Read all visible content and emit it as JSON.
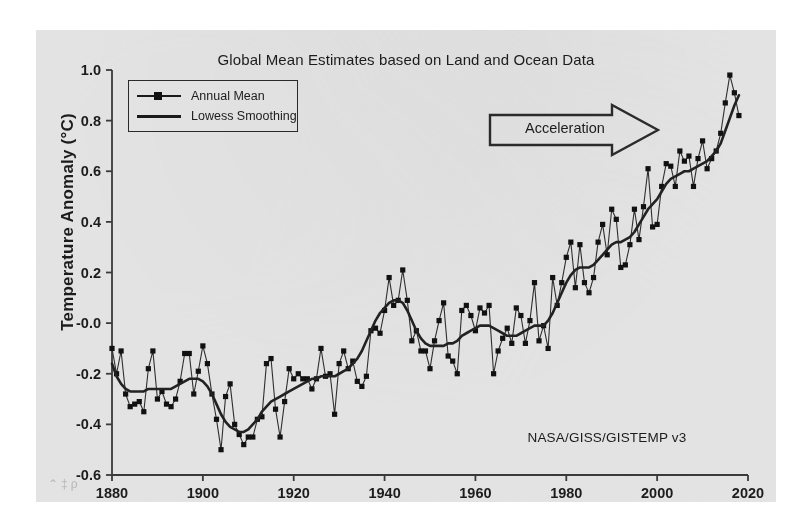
{
  "figure": {
    "title": "Global Mean Estimates based on Land and Ocean Data",
    "credit": "NASA/GISS/GISTEMP v3",
    "watermark": "⌃‡ρ"
  },
  "legend": {
    "items": [
      {
        "label": "Annual Mean",
        "key": "line-with-square-marker"
      },
      {
        "label": "Lowess Smoothing",
        "key": "plain-line"
      }
    ]
  },
  "annotation": {
    "label": "Acceleration",
    "shape": "right-block-arrow"
  },
  "axes": {
    "y_title": "Temperature Anomaly (°C)",
    "y_ticks": [
      "1.0",
      "0.8",
      "0.6",
      "0.4",
      "0.2",
      "-0.0",
      "-0.2",
      "-0.4",
      "-0.6"
    ],
    "x_ticks": [
      "1880",
      "1900",
      "1920",
      "1940",
      "1960",
      "1980",
      "2000",
      "2020"
    ]
  },
  "chart_data": {
    "type": "line",
    "title": "Global Mean Estimates based on Land and Ocean Data",
    "xlabel": "",
    "ylabel": "Temperature Anomaly (°C)",
    "xlim": [
      1880,
      2020
    ],
    "ylim": [
      -0.6,
      1.0
    ],
    "yticks": [
      -0.6,
      -0.4,
      -0.2,
      -0.0,
      0.2,
      0.4,
      0.6,
      0.8,
      1.0
    ],
    "xticks": [
      1880,
      1900,
      1920,
      1940,
      1960,
      1980,
      2000,
      2020
    ],
    "grid": false,
    "legend_position": "upper-left",
    "annotations": [
      {
        "text": "Acceleration",
        "x": 1990,
        "y": 0.83
      },
      {
        "text": "NASA/GISS/GISTEMP v3",
        "x": 1999,
        "y": -0.5
      }
    ],
    "x": [
      1880,
      1881,
      1882,
      1883,
      1884,
      1885,
      1886,
      1887,
      1888,
      1889,
      1890,
      1891,
      1892,
      1893,
      1894,
      1895,
      1896,
      1897,
      1898,
      1899,
      1900,
      1901,
      1902,
      1903,
      1904,
      1905,
      1906,
      1907,
      1908,
      1909,
      1910,
      1911,
      1912,
      1913,
      1914,
      1915,
      1916,
      1917,
      1918,
      1919,
      1920,
      1921,
      1922,
      1923,
      1924,
      1925,
      1926,
      1927,
      1928,
      1929,
      1930,
      1931,
      1932,
      1933,
      1934,
      1935,
      1936,
      1937,
      1938,
      1939,
      1940,
      1941,
      1942,
      1943,
      1944,
      1945,
      1946,
      1947,
      1948,
      1949,
      1950,
      1951,
      1952,
      1953,
      1954,
      1955,
      1956,
      1957,
      1958,
      1959,
      1960,
      1961,
      1962,
      1963,
      1964,
      1965,
      1966,
      1967,
      1968,
      1969,
      1970,
      1971,
      1972,
      1973,
      1974,
      1975,
      1976,
      1977,
      1978,
      1979,
      1980,
      1981,
      1982,
      1983,
      1984,
      1985,
      1986,
      1987,
      1988,
      1989,
      1990,
      1991,
      1992,
      1993,
      1994,
      1995,
      1996,
      1997,
      1998,
      1999,
      2000,
      2001,
      2002,
      2003,
      2004,
      2005,
      2006,
      2007,
      2008,
      2009,
      2010,
      2011,
      2012,
      2013,
      2014,
      2015,
      2016,
      2017,
      2018
    ],
    "series": [
      {
        "name": "Annual Mean",
        "marker": "square",
        "values": [
          -0.1,
          -0.2,
          -0.11,
          -0.28,
          -0.33,
          -0.32,
          -0.31,
          -0.35,
          -0.18,
          -0.11,
          -0.3,
          -0.27,
          -0.32,
          -0.33,
          -0.3,
          -0.23,
          -0.12,
          -0.12,
          -0.28,
          -0.19,
          -0.09,
          -0.16,
          -0.28,
          -0.38,
          -0.5,
          -0.29,
          -0.24,
          -0.4,
          -0.44,
          -0.48,
          -0.45,
          -0.45,
          -0.38,
          -0.37,
          -0.16,
          -0.14,
          -0.34,
          -0.45,
          -0.31,
          -0.18,
          -0.22,
          -0.2,
          -0.22,
          -0.22,
          -0.26,
          -0.22,
          -0.1,
          -0.21,
          -0.2,
          -0.36,
          -0.16,
          -0.11,
          -0.18,
          -0.15,
          -0.23,
          -0.25,
          -0.21,
          -0.03,
          -0.02,
          -0.04,
          0.05,
          0.18,
          0.07,
          0.09,
          0.21,
          0.09,
          -0.07,
          -0.03,
          -0.11,
          -0.11,
          -0.18,
          -0.07,
          0.01,
          0.08,
          -0.13,
          -0.15,
          -0.2,
          0.05,
          0.07,
          0.03,
          -0.03,
          0.06,
          0.04,
          0.07,
          -0.2,
          -0.11,
          -0.06,
          -0.02,
          -0.08,
          0.06,
          0.03,
          -0.08,
          0.01,
          0.16,
          -0.07,
          -0.01,
          -0.1,
          0.18,
          0.07,
          0.16,
          0.26,
          0.32,
          0.14,
          0.31,
          0.16,
          0.12,
          0.18,
          0.32,
          0.39,
          0.27,
          0.45,
          0.41,
          0.22,
          0.23,
          0.31,
          0.45,
          0.33,
          0.46,
          0.61,
          0.38,
          0.39,
          0.54,
          0.63,
          0.62,
          0.54,
          0.68,
          0.64,
          0.66,
          0.54,
          0.65,
          0.72,
          0.61,
          0.65,
          0.68,
          0.75,
          0.87,
          0.98,
          0.91,
          0.82
        ]
      },
      {
        "name": "Lowess Smoothing",
        "marker": "none",
        "values": [
          -0.16,
          -0.21,
          -0.24,
          -0.26,
          -0.27,
          -0.27,
          -0.27,
          -0.27,
          -0.26,
          -0.26,
          -0.26,
          -0.26,
          -0.26,
          -0.26,
          -0.25,
          -0.24,
          -0.23,
          -0.22,
          -0.22,
          -0.22,
          -0.23,
          -0.25,
          -0.28,
          -0.32,
          -0.36,
          -0.39,
          -0.41,
          -0.42,
          -0.43,
          -0.43,
          -0.42,
          -0.4,
          -0.38,
          -0.35,
          -0.33,
          -0.31,
          -0.3,
          -0.29,
          -0.28,
          -0.27,
          -0.26,
          -0.25,
          -0.24,
          -0.23,
          -0.22,
          -0.22,
          -0.21,
          -0.21,
          -0.21,
          -0.21,
          -0.2,
          -0.19,
          -0.18,
          -0.16,
          -0.14,
          -0.11,
          -0.07,
          -0.03,
          0.01,
          0.04,
          0.06,
          0.08,
          0.09,
          0.09,
          0.08,
          0.05,
          0.01,
          -0.03,
          -0.06,
          -0.08,
          -0.09,
          -0.09,
          -0.09,
          -0.09,
          -0.08,
          -0.08,
          -0.07,
          -0.05,
          -0.04,
          -0.03,
          -0.02,
          -0.01,
          -0.01,
          -0.01,
          -0.02,
          -0.03,
          -0.04,
          -0.05,
          -0.05,
          -0.05,
          -0.04,
          -0.03,
          -0.02,
          -0.01,
          -0.01,
          -0.01,
          0.01,
          0.04,
          0.08,
          0.12,
          0.16,
          0.19,
          0.21,
          0.22,
          0.22,
          0.22,
          0.23,
          0.25,
          0.27,
          0.29,
          0.31,
          0.32,
          0.32,
          0.33,
          0.34,
          0.36,
          0.39,
          0.42,
          0.45,
          0.47,
          0.49,
          0.52,
          0.55,
          0.57,
          0.58,
          0.59,
          0.6,
          0.6,
          0.61,
          0.62,
          0.63,
          0.64,
          0.66,
          0.68,
          0.71,
          0.76,
          0.81,
          0.86,
          0.9
        ]
      }
    ]
  }
}
